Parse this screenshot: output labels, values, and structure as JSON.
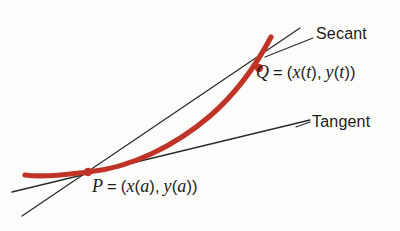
{
  "figure": {
    "background_color": "#fdfdfb",
    "curve_color": "#bf3427",
    "line_color": "#2b2b2b",
    "text_color": "#1b1b1b",
    "labels": {
      "secant": "Secant",
      "tangent": "Tangent",
      "point_q": {
        "name": "Q",
        "equals": "=",
        "open": "(",
        "x_fn": "x",
        "x_arg_open": "(",
        "x_arg": "t",
        "x_arg_close": ")",
        "comma": ",",
        "y_fn": "y",
        "y_arg_open": "(",
        "y_arg": "t",
        "y_arg_close": ")",
        "close": ")",
        "full_text": "Q = (x(t), y(t))"
      },
      "point_p": {
        "name": "P",
        "equals": "=",
        "open": "(",
        "x_fn": "x",
        "x_arg_open": "(",
        "x_arg": "a",
        "x_arg_close": ")",
        "comma": ",",
        "y_fn": "y",
        "y_arg_open": "(",
        "y_arg": "a",
        "y_arg_close": ")",
        "close": ")",
        "full_text": "P = (x(a), y(a))"
      }
    },
    "geometry": {
      "curve_path": "M 25 175 C 45 178, 70 174, 88 172 C 130 168, 175 146, 210 116 C 240 90, 260 58, 271 37",
      "secant_path": "M 22 216 L 300 28",
      "tangent_path": "M 12 192 L 310 120",
      "secant_leader_path": "M 313 38 L 265 57",
      "tangent_leader_path": "M 310 122 L 296 127",
      "point_p": {
        "cx": 88,
        "cy": 172,
        "r": 4.2
      },
      "point_q": {
        "cx": 259,
        "cy": 68,
        "r": 4.2
      },
      "curve_stroke_width": 5.2,
      "line_stroke_width": 1.3
    }
  }
}
